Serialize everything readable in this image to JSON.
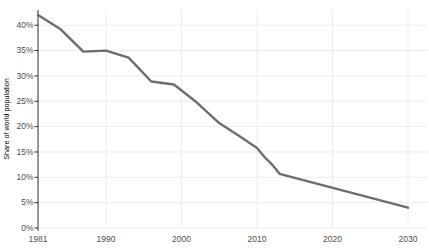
{
  "chart": {
    "background": "#ffffff",
    "line_color": "#6d6d6d",
    "axis_color": "#2e2e2e",
    "grid_color": "#ececec",
    "label_color": "#4d4d4d",
    "ylabel": "Share of world population"
  },
  "chart_data": {
    "type": "line",
    "title": "",
    "xlabel": "",
    "ylabel": "Share of world population",
    "series": [
      {
        "name": "Share of world population",
        "x": [
          1981,
          1984,
          1987,
          1990,
          1993,
          1996,
          1999,
          2002,
          2005,
          2008,
          2010,
          2011,
          2012,
          2013,
          2030
        ],
        "y": [
          42.0,
          39.2,
          34.8,
          35.0,
          33.6,
          28.9,
          28.3,
          24.8,
          20.7,
          17.8,
          15.8,
          14.0,
          12.5,
          10.7,
          4.0
        ]
      }
    ],
    "xlim": [
      1981,
      2030
    ],
    "ylim": [
      0,
      43
    ],
    "x_ticks": [
      1981,
      1990,
      2000,
      2010,
      2020,
      2030
    ],
    "y_ticks": [
      0,
      5,
      10,
      15,
      20,
      25,
      30,
      35,
      40
    ],
    "y_tick_suffix": "%",
    "grid": true,
    "legend_position": "none"
  }
}
